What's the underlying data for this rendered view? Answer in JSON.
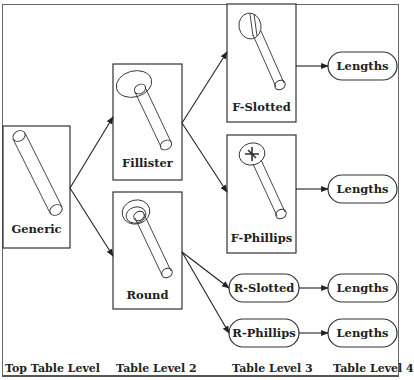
{
  "diagram": {
    "nodes": {
      "generic": {
        "label": "Generic",
        "kind": "image-box"
      },
      "fillister": {
        "label": "Fillister",
        "kind": "image-box"
      },
      "round": {
        "label": "Round",
        "kind": "image-box"
      },
      "f_slotted": {
        "label": "F-Slotted",
        "kind": "image-box"
      },
      "f_phillips": {
        "label": "F-Phillips",
        "kind": "image-box"
      },
      "r_slotted": {
        "label": "R-Slotted",
        "kind": "pill"
      },
      "r_phillips": {
        "label": "R-Phillips",
        "kind": "pill"
      },
      "lengths_1": {
        "label": "Lengths",
        "kind": "pill"
      },
      "lengths_2": {
        "label": "Lengths",
        "kind": "pill"
      },
      "lengths_3": {
        "label": "Lengths",
        "kind": "pill"
      },
      "lengths_4": {
        "label": "Lengths",
        "kind": "pill"
      }
    },
    "edges": [
      [
        "generic",
        "fillister"
      ],
      [
        "generic",
        "round"
      ],
      [
        "fillister",
        "f_slotted"
      ],
      [
        "fillister",
        "f_phillips"
      ],
      [
        "round",
        "r_slotted"
      ],
      [
        "round",
        "r_phillips"
      ],
      [
        "f_slotted",
        "lengths_1"
      ],
      [
        "f_phillips",
        "lengths_2"
      ],
      [
        "r_slotted",
        "lengths_3"
      ],
      [
        "r_phillips",
        "lengths_4"
      ]
    ],
    "levels": [
      "Top Table Level",
      "Table Level 2",
      "Table Level 3",
      "Table Level 4"
    ]
  }
}
